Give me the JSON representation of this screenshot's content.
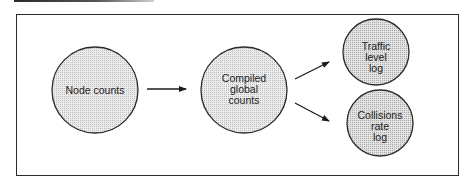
{
  "diagram": {
    "type": "flow",
    "nodes": [
      {
        "id": "node-counts",
        "lines": [
          "Node counts"
        ]
      },
      {
        "id": "compiled-global-counts",
        "lines": [
          "Compiled",
          "global",
          "counts"
        ]
      },
      {
        "id": "traffic-level-log",
        "lines": [
          "Traffic",
          "level",
          "log"
        ]
      },
      {
        "id": "collisions-rate-log",
        "lines": [
          "Collisions",
          "rate",
          "log"
        ]
      }
    ],
    "edges": [
      {
        "from": "node-counts",
        "to": "compiled-global-counts"
      },
      {
        "from": "compiled-global-counts",
        "to": "traffic-level-log"
      },
      {
        "from": "compiled-global-counts",
        "to": "collisions-rate-log"
      }
    ],
    "colors": {
      "stroke": "#2b2b2b",
      "fill_large": "#e4e4e4",
      "fill_small": "#d6d6d6",
      "background": "#ffffff"
    }
  }
}
